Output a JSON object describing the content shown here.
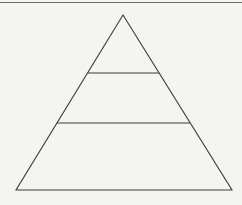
{
  "diagram": {
    "type": "pyramid",
    "tiers": [
      {
        "name": "top",
        "label": ""
      },
      {
        "name": "middle",
        "label": ""
      },
      {
        "name": "bottom",
        "label": ""
      }
    ],
    "colors": {
      "line": "#3a3a3a",
      "background": "#f4f4f2"
    }
  }
}
